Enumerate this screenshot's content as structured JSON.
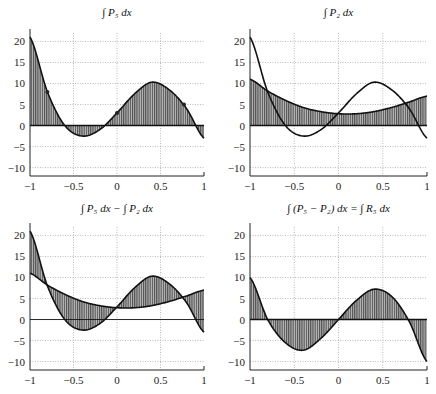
{
  "figure": {
    "width": 436,
    "height": 394
  },
  "chart_data": [
    {
      "type": "area",
      "title": "∫ P₅ dx",
      "xlabel": "",
      "ylabel": "",
      "xlim": [
        -1,
        1
      ],
      "ylim": [
        -12,
        22
      ],
      "xticks": [
        "-1",
        "-0.5",
        "0",
        "0.5",
        "1"
      ],
      "yticks": [
        "-10",
        "-5",
        "0",
        "5",
        "10",
        "15",
        "20"
      ],
      "grid": true,
      "series": [
        {
          "name": "∫P5 dx",
          "x": [
            -1,
            -0.8,
            -0.6,
            -0.4,
            -0.2,
            0,
            0.2,
            0.4,
            0.6,
            0.8,
            1
          ],
          "y": [
            21,
            8,
            0,
            -2.5,
            -1,
            3,
            7.5,
            10.3,
            8.5,
            4,
            -3
          ],
          "fill": "to-zero"
        }
      ],
      "markers": [
        {
          "x": -0.8,
          "y": 8
        },
        {
          "x": 0,
          "y": 3
        },
        {
          "x": 0.77,
          "y": 5
        }
      ]
    },
    {
      "type": "area",
      "title": "∫ P₂ dx",
      "xlim": [
        -1,
        1
      ],
      "ylim": [
        -12,
        22
      ],
      "xticks": [
        "-1",
        "-0.5",
        "0",
        "0.5",
        "1"
      ],
      "yticks": [
        "-10",
        "-5",
        "0",
        "5",
        "10",
        "15",
        "20"
      ],
      "grid": true,
      "series": [
        {
          "name": "∫P5 dx",
          "x": [
            -1,
            -0.8,
            -0.6,
            -0.4,
            -0.2,
            0,
            0.2,
            0.4,
            0.6,
            0.8,
            1
          ],
          "y": [
            21,
            8,
            0,
            -2.5,
            -1,
            3,
            7.5,
            10.3,
            8.5,
            4,
            -3
          ],
          "fill": "none"
        },
        {
          "name": "∫P2 dx",
          "x": [
            -1,
            -0.8,
            -0.6,
            -0.4,
            -0.2,
            0,
            0.2,
            0.4,
            0.6,
            0.8,
            1
          ],
          "y": [
            11,
            8.2,
            6,
            4.3,
            3.3,
            2.8,
            2.8,
            3.3,
            4.3,
            5.6,
            7
          ],
          "fill": "to-zero"
        }
      ]
    },
    {
      "type": "area",
      "title": "∫ P₅ dx − ∫ P₂ dx",
      "xlim": [
        -1,
        1
      ],
      "ylim": [
        -12,
        22
      ],
      "xticks": [
        "-1",
        "-0.5",
        "0",
        "0.5",
        "1"
      ],
      "yticks": [
        "-10",
        "-5",
        "0",
        "5",
        "10",
        "15",
        "20"
      ],
      "grid": true,
      "series": [
        {
          "name": "∫P5 dx",
          "x": [
            -1,
            -0.8,
            -0.6,
            -0.4,
            -0.2,
            0,
            0.2,
            0.4,
            0.6,
            0.8,
            1
          ],
          "y": [
            21,
            8,
            0,
            -2.5,
            -1,
            3,
            7.5,
            10.3,
            8.5,
            4,
            -3
          ]
        },
        {
          "name": "∫P2 dx",
          "x": [
            -1,
            -0.8,
            -0.6,
            -0.4,
            -0.2,
            0,
            0.2,
            0.4,
            0.6,
            0.8,
            1
          ],
          "y": [
            11,
            8.2,
            6,
            4.3,
            3.3,
            2.8,
            2.8,
            3.3,
            4.3,
            5.6,
            7
          ]
        }
      ],
      "fill": "between"
    },
    {
      "type": "area",
      "title": "∫ (P₅ − P₂) dx = ∫ R₅ dx",
      "xlim": [
        -1,
        1
      ],
      "ylim": [
        -12,
        22
      ],
      "xticks": [
        "-1",
        "-0.5",
        "0",
        "0.5",
        "1"
      ],
      "yticks": [
        "-10",
        "-5",
        "0",
        "5",
        "10",
        "15",
        "20"
      ],
      "grid": true,
      "series": [
        {
          "name": "∫R5 dx",
          "x": [
            -1,
            -0.8,
            -0.6,
            -0.4,
            -0.2,
            0,
            0.2,
            0.4,
            0.6,
            0.8,
            1
          ],
          "y": [
            10,
            0,
            -5.5,
            -7.3,
            -4.5,
            0,
            4.5,
            7.2,
            5.5,
            -0.5,
            -10
          ],
          "fill": "to-zero"
        }
      ]
    }
  ],
  "panels": [
    {
      "title": "∫ P₅ dx"
    },
    {
      "title": "∫ P₂ dx"
    },
    {
      "title": "∫ P₅ dx − ∫ P₂ dx"
    },
    {
      "title": "∫ (P₅ − P₂) dx = ∫ R₅ dx"
    }
  ]
}
